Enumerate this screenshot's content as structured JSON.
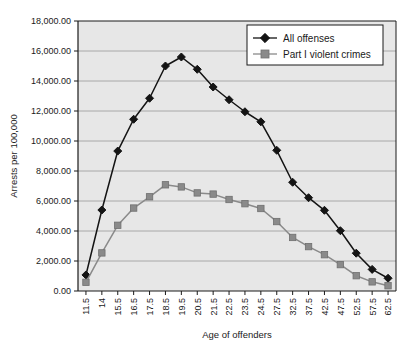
{
  "chart_data": {
    "type": "line",
    "title": "",
    "xlabel": "Age of offenders",
    "ylabel": "Arrests per 100,000",
    "categories": [
      "11.5",
      "14",
      "15.5",
      "16.5",
      "17.5",
      "18.5",
      "19.5",
      "20.5",
      "21.5",
      "22.5",
      "23.5",
      "24.5",
      "27.5",
      "32.5",
      "37.5",
      "42.5",
      "47.5",
      "52.5",
      "57.5",
      "62.5"
    ],
    "ylim": [
      0,
      18000
    ],
    "ytick_step": 2000,
    "ytick_labels": [
      "0.00",
      "2,000.00",
      "4,000.00",
      "6,000.00",
      "8,000.00",
      "10,000.00",
      "12,000.00",
      "14,000.00",
      "16,000.00",
      "18,000.00"
    ],
    "ytick_values": [
      0,
      2000,
      4000,
      6000,
      8000,
      10000,
      12000,
      14000,
      16000,
      18000
    ],
    "grid": true,
    "legend_position": "top-right",
    "series": [
      {
        "name": "All offenses",
        "color": "#141414",
        "marker": "diamond",
        "values": [
          1070,
          5400,
          9330,
          11450,
          12850,
          15000,
          15600,
          14780,
          13600,
          12750,
          11950,
          11280,
          9380,
          7250,
          6220,
          5380,
          4020,
          2520,
          1440,
          850
        ]
      },
      {
        "name": "Part I violent crimes",
        "color": "#8a8a8a",
        "marker": "square",
        "values": [
          580,
          2540,
          4380,
          5530,
          6280,
          7080,
          6940,
          6540,
          6460,
          6100,
          5820,
          5500,
          4630,
          3570,
          2960,
          2420,
          1760,
          1020,
          610,
          350
        ]
      }
    ]
  },
  "legend": {
    "entries": [
      {
        "label": "All offenses"
      },
      {
        "label": "Part I violent crimes"
      }
    ]
  },
  "axes": {
    "x_title": "Age of offenders",
    "y_title": "Arrests per 100,000"
  },
  "colors": {
    "plot_background": "#e7e7e7",
    "gridline": "#9a9a9a",
    "axis": "#1a1a1a",
    "series_all_offenses": "#141414",
    "series_part_i": "#8a8a8a",
    "legend_background": "#ffffff"
  }
}
